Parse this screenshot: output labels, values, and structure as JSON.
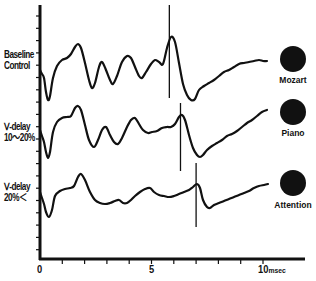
{
  "chart_data": {
    "type": "line",
    "title": "",
    "xlabel": "msec",
    "ylabel": "",
    "xlim": [
      0,
      11.5
    ],
    "x_ticks": [
      0,
      1,
      2,
      3,
      4,
      5,
      6,
      7,
      8,
      9,
      10
    ],
    "x_tick_labels": {
      "0": "0",
      "5": "5",
      "10": "10msec"
    },
    "grid": false,
    "legend": "right, black dot markers per trace",
    "series": [
      {
        "name": "Baseline Control",
        "condition": "Mozart",
        "label_lines": [
          "Baseline",
          "Control"
        ],
        "marker_latency_msec": 5.8,
        "points_px": [
          [
            40,
            70
          ],
          [
            42,
            74
          ],
          [
            44,
            78
          ],
          [
            46,
            92
          ],
          [
            48,
            100
          ],
          [
            50,
            96
          ],
          [
            53,
            78
          ],
          [
            57,
            66
          ],
          [
            62,
            60
          ],
          [
            67,
            58
          ],
          [
            71,
            54
          ],
          [
            75,
            47
          ],
          [
            78,
            44
          ],
          [
            81,
            48
          ],
          [
            85,
            63
          ],
          [
            89,
            80
          ],
          [
            92,
            88
          ],
          [
            95,
            83
          ],
          [
            99,
            67
          ],
          [
            102,
            62
          ],
          [
            106,
            70
          ],
          [
            110,
            80
          ],
          [
            113,
            84
          ],
          [
            117,
            76
          ],
          [
            122,
            62
          ],
          [
            127,
            56
          ],
          [
            131,
            58
          ],
          [
            135,
            67
          ],
          [
            139,
            76
          ],
          [
            142,
            78
          ],
          [
            146,
            72
          ],
          [
            151,
            64
          ],
          [
            155,
            60
          ],
          [
            159,
            62
          ],
          [
            163,
            64
          ],
          [
            167,
            48
          ],
          [
            171,
            37
          ],
          [
            175,
            42
          ],
          [
            179,
            63
          ],
          [
            183,
            84
          ],
          [
            187,
            95
          ],
          [
            191,
            100
          ],
          [
            195,
            99
          ],
          [
            199,
            90
          ],
          [
            204,
            86
          ],
          [
            209,
            83
          ],
          [
            214,
            80
          ],
          [
            219,
            76
          ],
          [
            224,
            72
          ],
          [
            229,
            70
          ],
          [
            234,
            67
          ],
          [
            239,
            64
          ],
          [
            244,
            63
          ],
          [
            249,
            62
          ],
          [
            254,
            61
          ],
          [
            259,
            60
          ],
          [
            263,
            61
          ],
          [
            267,
            61
          ]
        ]
      },
      {
        "name": "V-delay 10~20%",
        "condition": "Piano",
        "label_lines": [
          "Ⅴ-delay",
          "10～20%"
        ],
        "marker_latency_msec": 6.3,
        "points_px": [
          [
            40,
            130
          ],
          [
            42,
            136
          ],
          [
            44,
            142
          ],
          [
            46,
            152
          ],
          [
            48,
            158
          ],
          [
            50,
            152
          ],
          [
            53,
            132
          ],
          [
            57,
            122
          ],
          [
            62,
            118
          ],
          [
            67,
            117
          ],
          [
            71,
            116
          ],
          [
            75,
            108
          ],
          [
            78,
            106
          ],
          [
            81,
            110
          ],
          [
            85,
            125
          ],
          [
            89,
            140
          ],
          [
            94,
            147
          ],
          [
            98,
            140
          ],
          [
            102,
            130
          ],
          [
            106,
            127
          ],
          [
            110,
            135
          ],
          [
            114,
            142
          ],
          [
            118,
            144
          ],
          [
            122,
            138
          ],
          [
            127,
            127
          ],
          [
            131,
            120
          ],
          [
            135,
            118
          ],
          [
            139,
            124
          ],
          [
            143,
            130
          ],
          [
            148,
            133
          ],
          [
            152,
            132
          ],
          [
            157,
            131
          ],
          [
            162,
            128
          ],
          [
            167,
            127
          ],
          [
            171,
            127
          ],
          [
            175,
            124
          ],
          [
            179,
            117
          ],
          [
            182,
            115
          ],
          [
            185,
            120
          ],
          [
            189,
            135
          ],
          [
            193,
            148
          ],
          [
            197,
            155
          ],
          [
            200,
            157
          ],
          [
            203,
            155
          ],
          [
            207,
            150
          ],
          [
            212,
            146
          ],
          [
            217,
            143
          ],
          [
            222,
            140
          ],
          [
            227,
            136
          ],
          [
            232,
            134
          ],
          [
            237,
            131
          ],
          [
            242,
            127
          ],
          [
            247,
            123
          ],
          [
            252,
            120
          ],
          [
            257,
            116
          ],
          [
            262,
            112
          ],
          [
            267,
            110
          ]
        ]
      },
      {
        "name": "V-delay 20%<",
        "condition": "Attention",
        "label_lines": [
          "Ⅴ-delay",
          "20%＜"
        ],
        "marker_latency_msec": 7.0,
        "points_px": [
          [
            40,
            192
          ],
          [
            42,
            198
          ],
          [
            44,
            204
          ],
          [
            46,
            212
          ],
          [
            49,
            217
          ],
          [
            52,
            210
          ],
          [
            55,
            196
          ],
          [
            60,
            191
          ],
          [
            65,
            189
          ],
          [
            70,
            188
          ],
          [
            74,
            186
          ],
          [
            78,
            177
          ],
          [
            81,
            174
          ],
          [
            85,
            180
          ],
          [
            90,
            192
          ],
          [
            95,
            200
          ],
          [
            100,
            203
          ],
          [
            105,
            204
          ],
          [
            110,
            203
          ],
          [
            115,
            201
          ],
          [
            119,
            200
          ],
          [
            123,
            203
          ],
          [
            127,
            203
          ],
          [
            131,
            200
          ],
          [
            135,
            196
          ],
          [
            140,
            192
          ],
          [
            145,
            189
          ],
          [
            150,
            188
          ],
          [
            154,
            192
          ],
          [
            159,
            195
          ],
          [
            164,
            196
          ],
          [
            169,
            197
          ],
          [
            174,
            196
          ],
          [
            179,
            194
          ],
          [
            184,
            192
          ],
          [
            189,
            190
          ],
          [
            193,
            187
          ],
          [
            197,
            184
          ],
          [
            200,
            188
          ],
          [
            203,
            200
          ],
          [
            207,
            207
          ],
          [
            210,
            208
          ],
          [
            214,
            205
          ],
          [
            219,
            203
          ],
          [
            224,
            201
          ],
          [
            229,
            199
          ],
          [
            234,
            197
          ],
          [
            239,
            195
          ],
          [
            244,
            193
          ],
          [
            249,
            191
          ],
          [
            254,
            188
          ],
          [
            259,
            186
          ],
          [
            264,
            185
          ],
          [
            268,
            184
          ]
        ]
      }
    ],
    "axis_px": {
      "origin_x": 40,
      "origin_y": 259,
      "y_top": 5,
      "x_end": 305,
      "px_per_msec": 22.3
    }
  },
  "labels": {
    "rows": [
      {
        "line1": "Baseline",
        "line2": "Control"
      },
      {
        "line1": "Ⅴ-delay",
        "line2": "10～20%"
      },
      {
        "line1": "Ⅴ-delay",
        "line2": "20%＜"
      }
    ],
    "dots": [
      "Mozart",
      "Piano",
      "Attention"
    ],
    "x_tick_0": "0",
    "x_tick_5": "5",
    "x_tick_10": "10",
    "x_unit": "msec"
  },
  "colors": {
    "ink": "#111111",
    "background": "#ffffff"
  }
}
